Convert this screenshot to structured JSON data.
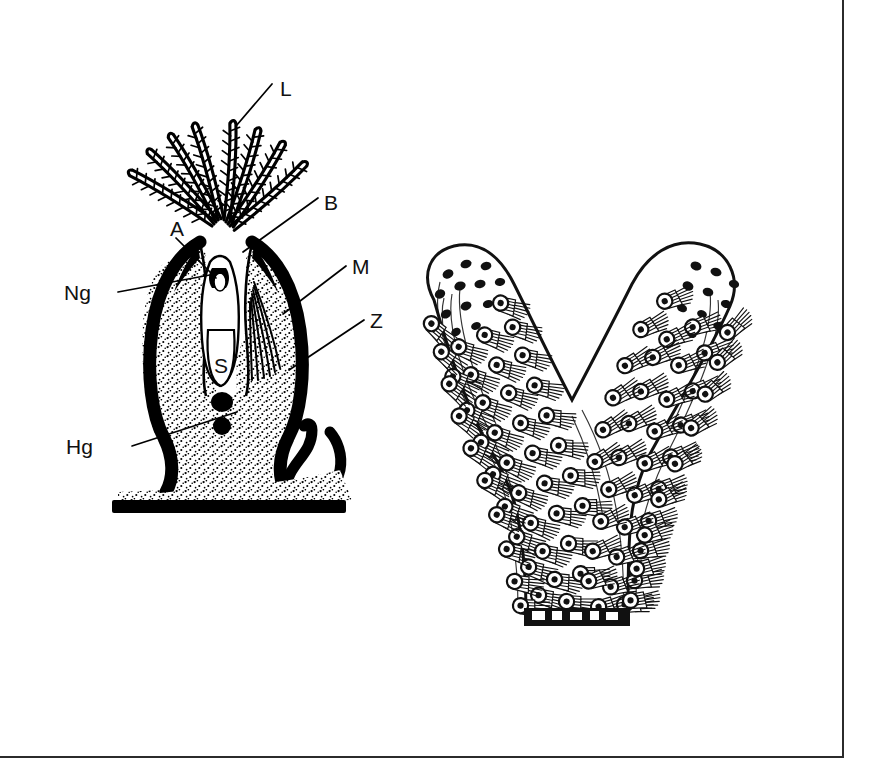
{
  "plate": {
    "background_color": "#ffffff",
    "ink_color": "#000000",
    "frame_color": "#2b2b2b",
    "figure_count": 2
  },
  "figures": [
    {
      "id": "zooid-section",
      "name": "bryozoan-zooid-longitudinal-section",
      "position": "left",
      "labels": [
        {
          "key": "L",
          "text": "L",
          "x": 240,
          "y": 58,
          "leader_to_x": 196,
          "leader_to_y": 96,
          "structure": "lophophore-tentacle"
        },
        {
          "key": "B",
          "text": "B",
          "x": 284,
          "y": 172,
          "leader_to_x": 203,
          "leader_to_y": 222,
          "structure": "introvert-tentacle-sheath"
        },
        {
          "key": "A",
          "text": "A",
          "x": 133,
          "y": 198,
          "leader_to_x": 174,
          "leader_to_y": 246,
          "structure": "anus"
        },
        {
          "key": "Ng",
          "text": "Ng",
          "x": 54,
          "y": 264,
          "leader_to_x": 185,
          "leader_to_y": 242,
          "structure": "nerve-ganglion"
        },
        {
          "key": "M",
          "text": "M",
          "x": 312,
          "y": 240,
          "leader_to_x": 243,
          "leader_to_y": 284,
          "structure": "retractor-muscle"
        },
        {
          "key": "Z",
          "text": "Z",
          "x": 330,
          "y": 293,
          "leader_to_x": 249,
          "leader_to_y": 340,
          "structure": "zooecium-cystid-wall"
        },
        {
          "key": "S",
          "text": "S",
          "x": 183,
          "y": 345,
          "leader_to_x": null,
          "leader_to_y": null,
          "structure": "stomach"
        },
        {
          "key": "Hg",
          "text": "Hg",
          "x": 66,
          "y": 418,
          "leader_to_x": 197,
          "leader_to_y": 382,
          "structure": "hibernaculum-gonad-body"
        }
      ],
      "anatomy": {
        "tentacle_count": 8,
        "dark_bodies_count": 2,
        "wall_style": "thick-black-outline",
        "interior_fill": "stippled"
      }
    },
    {
      "id": "colony-branch",
      "name": "bryozoan-colony-bifurcating-branch",
      "position": "right",
      "shape": "Y-shaped bifurcating branch",
      "zooid_aperture_count": 92,
      "tip_bud_count": 22,
      "base_style": "dark-serrated-broken-edge",
      "labels": []
    }
  ]
}
